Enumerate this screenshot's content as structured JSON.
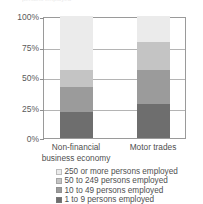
{
  "top_caption_remnant": "persons employed",
  "chart_data": {
    "type": "bar",
    "stacked": true,
    "normalized_percent": true,
    "title": "",
    "subtitle": "",
    "xlabel": "",
    "ylabel": "",
    "ylim": [
      0,
      100
    ],
    "ytick_labels": [
      "100%",
      "75%",
      "50%",
      "25%",
      "0%"
    ],
    "ytick_values": [
      100,
      75,
      50,
      25,
      0
    ],
    "grid": true,
    "legend_position": "bottom",
    "categories": [
      "Non-financial business economy",
      "Motor trades"
    ],
    "category_lines": [
      [
        "Non-financial",
        "business economy"
      ],
      [
        "Motor trades"
      ]
    ],
    "series": [
      {
        "name": "250 or more persons employed",
        "color": "#ebebeb",
        "values": [
          44,
          21
        ]
      },
      {
        "name": "50 to 249 persons employed",
        "color": "#c4c4c4",
        "values": [
          14,
          23
        ]
      },
      {
        "name": "10 to 49 persons employed",
        "color": "#9b9b9b",
        "values": [
          21,
          28
        ]
      },
      {
        "name": "1 to 9 persons employed",
        "color": "#6e6e6e",
        "values": [
          21,
          28
        ]
      }
    ],
    "stack_boundaries_percent": {
      "Non-financial business economy": [
        21,
        42,
        56,
        100
      ],
      "Motor trades": [
        28,
        56,
        79,
        100
      ]
    }
  },
  "legend": {
    "items": [
      {
        "label": "250 or more persons employed",
        "color": "#ebebeb"
      },
      {
        "label": "50 to 249 persons employed",
        "color": "#c4c4c4"
      },
      {
        "label": "10 to 49 persons employed",
        "color": "#9b9b9b"
      },
      {
        "label": "1 to 9 persons employed",
        "color": "#6e6e6e"
      }
    ]
  }
}
